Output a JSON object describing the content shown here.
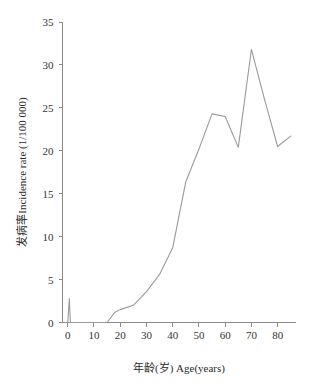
{
  "chart_data": {
    "type": "line",
    "title": "",
    "subtitle": "",
    "xlabel": "年龄(岁) Age(years)",
    "ylabel": "发病率Incidence rate (1/100 000)",
    "xlim": [
      -2,
      87
    ],
    "ylim": [
      0,
      35
    ],
    "grid": false,
    "legend": null,
    "x_ticks": [
      0,
      10,
      20,
      30,
      40,
      50,
      60,
      70,
      80
    ],
    "x_tick_labels": [
      "0",
      "10",
      "20",
      "30",
      "40",
      "50",
      "60",
      "70",
      "80"
    ],
    "y_ticks": [
      0,
      5,
      10,
      15,
      20,
      25,
      30,
      35
    ],
    "y_tick_labels": [
      "0",
      "5",
      "10",
      "15",
      "20",
      "25",
      "30",
      "35"
    ],
    "line_color": "#9a9a9a",
    "axis_color": "#8a8a8a",
    "series": [
      {
        "name": "Incidence rate",
        "x": [
          0,
          0.6,
          1,
          15,
          18,
          20,
          25,
          30,
          35,
          40,
          45,
          50,
          55,
          60,
          65,
          70,
          75,
          80,
          85
        ],
        "values": [
          0,
          2.8,
          0,
          0,
          1.2,
          1.5,
          2.0,
          3.6,
          5.6,
          8.7,
          16.4,
          20.2,
          24.3,
          24.0,
          20.4,
          31.8,
          26.0,
          20.5,
          21.7
        ]
      }
    ],
    "annotations": []
  },
  "axes": {
    "y_axis_title": "发病率Incidence rate (1/100 000)",
    "x_axis_title": "年龄(岁) Age(years)"
  }
}
